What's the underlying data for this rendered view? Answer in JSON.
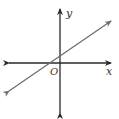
{
  "diagram": {
    "type": "coordinate-plane-line",
    "labels": {
      "x_axis": "x",
      "y_axis": "y",
      "origin": "O"
    },
    "colors": {
      "axes": "#2a2a2a",
      "line": "#6e6e6e",
      "background": "#ffffff"
    }
  }
}
